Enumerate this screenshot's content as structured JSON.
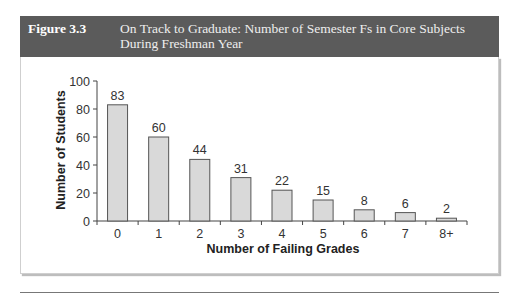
{
  "figure": {
    "number": "Figure 3.3",
    "title_line1": "On Track to Graduate: Number of Semester Fs in Core Subjects",
    "title_line2": "During Freshman Year"
  },
  "chart_data": {
    "type": "bar",
    "title": "On Track to Graduate: Number of Semester Fs in Core Subjects During Freshman Year",
    "categories": [
      "0",
      "1",
      "2",
      "3",
      "4",
      "5",
      "6",
      "7",
      "8+"
    ],
    "values": [
      83,
      60,
      44,
      31,
      22,
      15,
      8,
      6,
      2
    ],
    "data_labels": [
      "83",
      "60",
      "44",
      "31",
      "22",
      "15",
      "8",
      "6",
      "2"
    ],
    "xlabel": "Number of Failing Grades",
    "ylabel": "Number of Students",
    "ylim": [
      0,
      100
    ],
    "yticks": [
      0,
      20,
      40,
      60,
      80,
      100
    ],
    "grid": false,
    "legend": null,
    "bar_color": "#d9d9d9",
    "bar_edge_color": "#555555"
  }
}
